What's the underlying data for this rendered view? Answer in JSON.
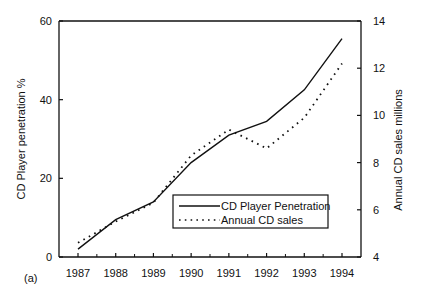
{
  "panel_label": "(a)",
  "legend": {
    "items": [
      {
        "label": "CD Player Penetration",
        "style": "solid"
      },
      {
        "label": "Annual CD sales",
        "style": "dotted"
      }
    ]
  },
  "chart_data": {
    "type": "line",
    "title": "",
    "panel": "(a)",
    "categories": [
      "1987",
      "1988",
      "1989",
      "1990",
      "1991",
      "1992",
      "1993",
      "1994"
    ],
    "x": [
      1987,
      1988,
      1989,
      1990,
      1991,
      1992,
      1993,
      1994
    ],
    "xlabel": "",
    "ylabel": "CD Player penetration  %",
    "ylabel_right": "Annual CD sales millions",
    "ylim": [
      0,
      60
    ],
    "ylim_right": [
      4,
      14
    ],
    "yticks": [
      0,
      20,
      40,
      60
    ],
    "yticks_right": [
      4,
      6,
      8,
      10,
      12,
      14
    ],
    "grid": false,
    "legend_position": "lower right (inside plot)",
    "series": [
      {
        "name": "CD Player Penetration",
        "axis": "left",
        "style": "solid",
        "values": [
          2,
          9.5,
          14,
          24,
          31,
          34.5,
          42.5,
          55.5
        ]
      },
      {
        "name": "Annual CD sales",
        "axis": "right",
        "style": "dotted",
        "values": [
          4.6,
          5.5,
          6.3,
          8.3,
          9.4,
          8.6,
          9.9,
          12.2
        ]
      }
    ],
    "colors": {
      "line": "#111111",
      "background": "#ffffff"
    }
  }
}
